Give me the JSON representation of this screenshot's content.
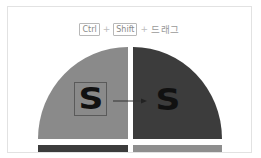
{
  "hint": {
    "key1": "Ctrl",
    "plus1": "+",
    "key2": "Shift",
    "plus2": "+",
    "action": "드래그"
  },
  "diagram": {
    "left_glyph": "S",
    "right_glyph": "S",
    "colors": {
      "left_half": "#8a8a8a",
      "right_half": "#3c3c3c",
      "bar_left": "#3c3c3c",
      "bar_right": "#8e8e8e",
      "border": "#e2e2e2"
    }
  }
}
